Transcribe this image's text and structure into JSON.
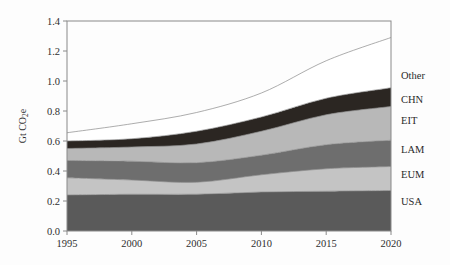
{
  "chart_data": {
    "type": "area",
    "title": "",
    "subtitle": "",
    "xlabel": "",
    "ylabel": "Gt CO₂e",
    "ylabel_parts": {
      "prefix": "Gt CO",
      "sub": "2",
      "suffix": "e"
    },
    "x": [
      1995,
      2000,
      2005,
      2010,
      2015,
      2020
    ],
    "xlim": [
      1995,
      2020
    ],
    "ylim": [
      0.0,
      1.4
    ],
    "xticks": [
      1995,
      2000,
      2005,
      2010,
      2015,
      2020
    ],
    "xtick_labels": [
      "1995",
      "2000",
      "2005",
      "2010",
      "2015",
      "2020"
    ],
    "yticks": [
      0.0,
      0.2,
      0.4,
      0.6,
      0.8,
      1.0,
      1.2,
      1.4
    ],
    "ytick_labels": [
      "0.0",
      "0.2",
      "0.4",
      "0.6",
      "0.8",
      "1.0",
      "1.2",
      "1.4"
    ],
    "grid": false,
    "legend_position": "right-outside",
    "stacked": true,
    "series": [
      {
        "name": "USA",
        "label": "USA",
        "color": "#5a5a5a",
        "values": [
          0.24,
          0.245,
          0.245,
          0.26,
          0.265,
          0.27
        ]
      },
      {
        "name": "EUM",
        "label": "EUM",
        "color": "#c4c4c4",
        "values": [
          0.115,
          0.095,
          0.08,
          0.115,
          0.15,
          0.16
        ]
      },
      {
        "name": "LAM",
        "label": "LAM",
        "color": "#6e6e6e",
        "values": [
          0.115,
          0.125,
          0.13,
          0.13,
          0.16,
          0.175
        ]
      },
      {
        "name": "EIT",
        "label": "EIT",
        "color": "#b8b8b8",
        "values": [
          0.08,
          0.095,
          0.125,
          0.16,
          0.2,
          0.225
        ]
      },
      {
        "name": "CHN",
        "label": "CHN",
        "color": "#2b2622",
        "values": [
          0.05,
          0.055,
          0.085,
          0.095,
          0.11,
          0.125
        ]
      },
      {
        "name": "Other",
        "label": "Other",
        "color": "#ffffff",
        "values": [
          0.055,
          0.1,
          0.125,
          0.16,
          0.25,
          0.335
        ]
      }
    ],
    "cumulative_tops": {
      "USA": [
        0.24,
        0.245,
        0.245,
        0.26,
        0.265,
        0.27
      ],
      "EUM": [
        0.355,
        0.34,
        0.325,
        0.375,
        0.415,
        0.43
      ],
      "LAM": [
        0.47,
        0.465,
        0.455,
        0.505,
        0.575,
        0.605
      ],
      "EIT": [
        0.55,
        0.56,
        0.58,
        0.665,
        0.775,
        0.83
      ],
      "CHN": [
        0.6,
        0.615,
        0.665,
        0.76,
        0.885,
        0.955
      ],
      "Other": [
        0.655,
        0.715,
        0.79,
        0.92,
        1.135,
        1.29
      ]
    }
  },
  "legend": {
    "items": [
      {
        "label": "Other",
        "y_value": 1.04
      },
      {
        "label": "CHN",
        "y_value": 0.875
      },
      {
        "label": "EIT",
        "y_value": 0.735
      },
      {
        "label": "LAM",
        "y_value": 0.545
      },
      {
        "label": "EUM",
        "y_value": 0.375
      },
      {
        "label": "USA",
        "y_value": 0.195
      }
    ]
  }
}
